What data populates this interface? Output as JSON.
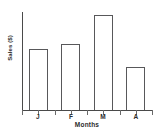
{
  "chart_data": {
    "type": "bar",
    "title": "",
    "categories": [
      "J",
      "F",
      "M",
      "A"
    ],
    "values": [
      62,
      67,
      97,
      44
    ],
    "series": [
      {
        "name": "Sales",
        "values": [
          62,
          67,
          97,
          44
        ]
      }
    ],
    "xlabel": "Months",
    "ylabel": "Sales ($)",
    "ylim": [
      0,
      100
    ],
    "xtick_labels": [
      "J",
      "F",
      "M",
      "A"
    ],
    "ytick_labels": [],
    "grid": false,
    "legend": false,
    "legend_position": "none",
    "bar_fill_color": "#ffffff",
    "bar_border_color": "#58585a",
    "axis_color": "#4a4a4a",
    "text_color": "#2b2b2b",
    "background_color": "#ffffff",
    "annotations": []
  },
  "axes": {
    "x_title": "Months",
    "y_title": "Sales ($)"
  }
}
